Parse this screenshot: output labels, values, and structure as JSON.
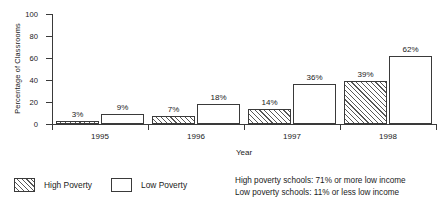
{
  "chart_data": {
    "type": "bar",
    "title": "",
    "xlabel": "Year",
    "ylabel": "Percentage of Classrooms",
    "categories": [
      "1995",
      "1996",
      "1997",
      "1998"
    ],
    "series": [
      {
        "name": "High Poverty",
        "values": [
          3,
          7,
          14,
          39
        ],
        "fill": "diagonal-hatch"
      },
      {
        "name": "Low Poverty",
        "values": [
          9,
          18,
          36,
          62
        ],
        "fill": "white"
      }
    ],
    "value_labels": [
      [
        "3%",
        "9%"
      ],
      [
        "7%",
        "18%"
      ],
      [
        "14%",
        "36%"
      ],
      [
        "39%",
        "62%"
      ]
    ],
    "ylim": [
      0,
      100
    ],
    "yticks": [
      0,
      20,
      40,
      60,
      80,
      100
    ],
    "ytick_labels": [
      "0",
      "20",
      "40",
      "60",
      "80",
      "100"
    ],
    "grid": false,
    "legend_position": "below-left"
  },
  "legend": {
    "entries": [
      {
        "label": "High Poverty",
        "swatch": "diagonal-hatch"
      },
      {
        "label": "Low Poverty",
        "swatch": "white"
      }
    ]
  },
  "footnotes": {
    "line1": "High poverty schools: 71% or more low income",
    "line2": "Low poverty schools: 11% or less low income"
  },
  "colors": {
    "ink": "#3a3a3a",
    "hatch": "#575757",
    "background": "#ffffff"
  }
}
